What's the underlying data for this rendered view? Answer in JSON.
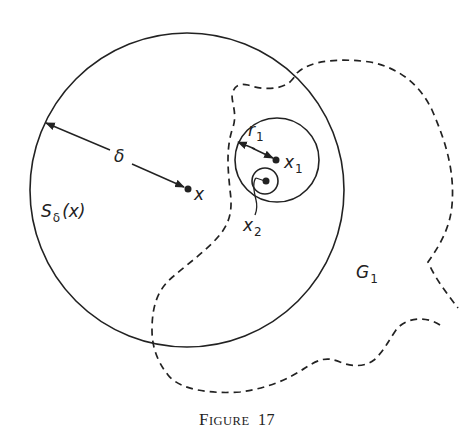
{
  "figure": {
    "caption": {
      "prefix_big": "F",
      "prefix_small": "igure",
      "number": "17"
    },
    "colors": {
      "ink": "#222222",
      "background": "#ffffff"
    },
    "shapes": {
      "big_circle": {
        "cx": 187,
        "cy": 190,
        "r": 157,
        "style": "solid"
      },
      "medium_circle": {
        "cx": 277,
        "cy": 160,
        "r": 42,
        "style": "solid"
      },
      "small_circle": {
        "cx": 264,
        "cy": 181,
        "r": 13,
        "style": "solid"
      },
      "region_boundary": {
        "style": "dashed",
        "name": "G1 boundary"
      }
    },
    "points": {
      "x": {
        "cx": 188,
        "cy": 189
      },
      "x1": {
        "cx": 276,
        "cy": 160
      },
      "x2": {
        "cx": 266,
        "cy": 181
      }
    },
    "labels": {
      "delta": "δ",
      "x": "x",
      "x1_main": "x",
      "x1_sub": "1",
      "x2_main": "x",
      "x2_sub": "2",
      "r1_main": "r",
      "r1_sub": "1",
      "S_main": "S",
      "S_sub": "δ",
      "S_arg": "(x)",
      "G_main": "G",
      "G_sub": "1"
    }
  }
}
